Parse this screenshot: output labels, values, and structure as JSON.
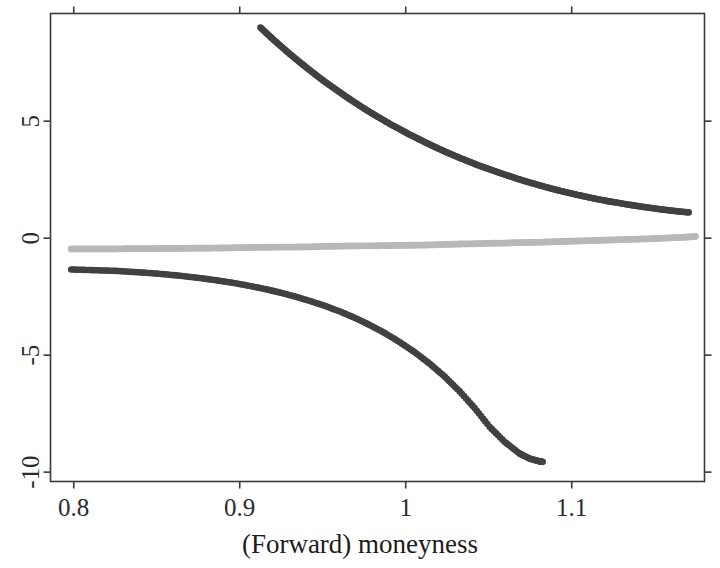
{
  "chart_data": {
    "type": "scatter",
    "title": "",
    "xlabel": "(Forward) moneyness",
    "ylabel": "",
    "xlim": [
      0.786,
      1.18
    ],
    "ylim": [
      -10.4,
      9.6
    ],
    "grid": false,
    "legend": "none",
    "x_ticks": [
      0.8,
      0.9,
      1,
      1.1
    ],
    "x_tick_labels": [
      "0.8",
      "0.9",
      "1",
      "1.1"
    ],
    "y_ticks": [
      5,
      0,
      -5,
      -10
    ],
    "y_tick_labels": [
      "5",
      "0",
      "-5",
      "-10"
    ],
    "series": [
      {
        "name": "upper-branch",
        "color": "#414141",
        "marker": "filled-circle",
        "x": [
          0.9125,
          0.9185,
          0.9245,
          0.9305,
          0.9365,
          0.9425,
          0.9485,
          0.9545,
          0.9605,
          0.9665,
          0.9725,
          0.9785,
          0.9845,
          0.9905,
          0.9965,
          1.0025,
          1.0085,
          1.0145,
          1.0205,
          1.0265,
          1.0325,
          1.0385,
          1.0445,
          1.0505,
          1.0565,
          1.0625,
          1.0685,
          1.0745,
          1.0805,
          1.0865,
          1.0925,
          1.0985,
          1.1045,
          1.1105,
          1.1165,
          1.1225,
          1.1285,
          1.1345,
          1.1405,
          1.1465,
          1.1525,
          1.1585,
          1.1645,
          1.1705
        ],
        "y": [
          9.0,
          8.6,
          8.22,
          7.85,
          7.5,
          7.16,
          6.83,
          6.52,
          6.22,
          5.93,
          5.65,
          5.38,
          5.13,
          4.88,
          4.65,
          4.42,
          4.21,
          4.0,
          3.8,
          3.61,
          3.43,
          3.26,
          3.09,
          2.94,
          2.79,
          2.65,
          2.51,
          2.38,
          2.26,
          2.14,
          2.03,
          1.93,
          1.83,
          1.74,
          1.65,
          1.57,
          1.5,
          1.43,
          1.36,
          1.3,
          1.24,
          1.19,
          1.14,
          1.1
        ]
      },
      {
        "name": "middle-branch",
        "color": "#b8b8b8",
        "marker": "filled-circle",
        "x": [
          0.7985,
          0.8075,
          0.8165,
          0.8255,
          0.8345,
          0.8435,
          0.8525,
          0.8615,
          0.8705,
          0.8795,
          0.8885,
          0.8975,
          0.9065,
          0.9155,
          0.9245,
          0.9335,
          0.9425,
          0.9515,
          0.9605,
          0.9695,
          0.9785,
          0.9875,
          0.9965,
          1.0055,
          1.0145,
          1.0235,
          1.0325,
          1.0415,
          1.0505,
          1.0595,
          1.0685,
          1.0775,
          1.0865,
          1.0955,
          1.1045,
          1.1135,
          1.1225,
          1.1315,
          1.1405,
          1.1495,
          1.1585,
          1.1675,
          1.1745
        ],
        "y": [
          -0.46,
          -0.46,
          -0.46,
          -0.46,
          -0.45,
          -0.45,
          -0.44,
          -0.44,
          -0.43,
          -0.43,
          -0.42,
          -0.41,
          -0.4,
          -0.39,
          -0.38,
          -0.38,
          -0.37,
          -0.35,
          -0.34,
          -0.33,
          -0.33,
          -0.32,
          -0.31,
          -0.3,
          -0.29,
          -0.27,
          -0.25,
          -0.24,
          -0.22,
          -0.21,
          -0.19,
          -0.18,
          -0.16,
          -0.14,
          -0.12,
          -0.1,
          -0.08,
          -0.06,
          -0.04,
          -0.02,
          0.01,
          0.04,
          0.07
        ]
      },
      {
        "name": "lower-branch",
        "color": "#414141",
        "marker": "filled-circle",
        "x": [
          0.7985,
          0.8075,
          0.8165,
          0.8255,
          0.8345,
          0.8435,
          0.8525,
          0.8615,
          0.8705,
          0.8795,
          0.8885,
          0.8975,
          0.9065,
          0.9155,
          0.9245,
          0.9335,
          0.9425,
          0.9515,
          0.9605,
          0.9695,
          0.9785,
          0.9875,
          0.9965,
          1.0055,
          1.0145,
          1.0235,
          1.0325,
          1.0415,
          1.0505,
          1.0595,
          1.0685,
          1.0745,
          1.0795,
          1.0825
        ],
        "y": [
          -1.34,
          -1.36,
          -1.38,
          -1.4,
          -1.44,
          -1.48,
          -1.53,
          -1.59,
          -1.66,
          -1.74,
          -1.83,
          -1.93,
          -2.05,
          -2.18,
          -2.33,
          -2.5,
          -2.69,
          -2.9,
          -3.14,
          -3.41,
          -3.72,
          -4.06,
          -4.45,
          -4.88,
          -5.37,
          -5.92,
          -6.55,
          -7.26,
          -8.06,
          -8.7,
          -9.2,
          -9.42,
          -9.52,
          -9.56
        ]
      }
    ]
  },
  "axis": {
    "x_label": "(Forward) moneyness"
  }
}
